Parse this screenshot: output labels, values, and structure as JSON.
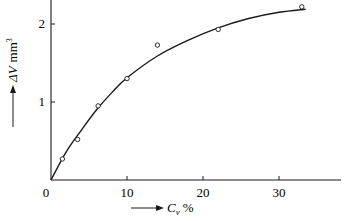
{
  "chart_data": {
    "type": "scatter",
    "title": "",
    "xlabel": "C_v %",
    "ylabel": "ΔV mm³",
    "xlabel_parts": {
      "symbol": "C",
      "subscript": "v",
      "unit": "%"
    },
    "ylabel_parts": {
      "symbol": "ΔV",
      "unit": "mm",
      "unit_exp": "3"
    },
    "xlim": [
      0,
      35
    ],
    "ylim": [
      0,
      2.3
    ],
    "x_ticks": [
      0,
      10,
      20,
      30
    ],
    "x_tick_labels": [
      "0",
      "10",
      "20",
      "30"
    ],
    "y_ticks": [
      1,
      2
    ],
    "y_tick_labels": [
      "1",
      "2"
    ],
    "grid": false,
    "legend": null,
    "series": [
      {
        "name": "measured",
        "marker": "open-circle",
        "x": [
          1.5,
          3.5,
          6.2,
          10.0,
          14.0,
          22.0,
          33.0
        ],
        "y": [
          0.27,
          0.52,
          0.95,
          1.3,
          1.73,
          1.93,
          2.22
        ]
      },
      {
        "name": "fitted curve",
        "style": "solid-line",
        "x": [
          0,
          2,
          4,
          6,
          8,
          10,
          14,
          18,
          22,
          26,
          30,
          33.5
        ],
        "y": [
          0,
          0.36,
          0.64,
          0.9,
          1.12,
          1.31,
          1.59,
          1.79,
          1.95,
          2.07,
          2.15,
          2.19
        ]
      }
    ]
  },
  "colors": {
    "ink": "#1a1a1a",
    "background": "#ffffff"
  }
}
